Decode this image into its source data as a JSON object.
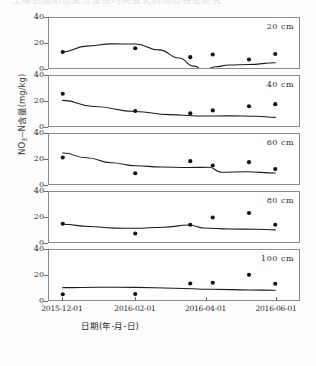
{
  "page": {
    "top_fragment": "土壤剖面硝态氮含量随时间变化的动态特征研究"
  },
  "chart_data": {
    "type": "scatter",
    "title": "",
    "subtitle": "",
    "xlabel": "日期(年-月-日)",
    "ylabel_html": "NO3--N含量(mg/kg)",
    "ylabel_parts": {
      "pre": "NO",
      "sub": "3",
      "post": "--N含量(mg/kg)"
    },
    "grid": false,
    "legend": "none",
    "ylim": [
      0,
      40
    ],
    "yticks": [
      0,
      20,
      40
    ],
    "xlim": [
      "2015-12-01",
      "2016-06-20"
    ],
    "xticks": [
      "2015-12-01",
      "2016-02-01",
      "2016-04-01",
      "2016-06-01"
    ],
    "xtick_positions": [
      0.055,
      0.345,
      0.625,
      0.905
    ],
    "panels": [
      {
        "depth_label": "20 cm",
        "points": [
          {
            "x": 0.055,
            "y": 12.8
          },
          {
            "x": 0.345,
            "y": 15.8
          },
          {
            "x": 0.565,
            "y": 8.7
          },
          {
            "x": 0.655,
            "y": 10.8
          },
          {
            "x": 0.8,
            "y": 6.8
          },
          {
            "x": 0.905,
            "y": 11.2
          }
        ],
        "fit": [
          {
            "x": 0.055,
            "y": 13.0
          },
          {
            "x": 0.15,
            "y": 17.5
          },
          {
            "x": 0.25,
            "y": 19.3
          },
          {
            "x": 0.345,
            "y": 19.2
          },
          {
            "x": 0.44,
            "y": 14.5
          },
          {
            "x": 0.52,
            "y": 8.0
          },
          {
            "x": 0.58,
            "y": 1.5
          },
          {
            "x": 0.62,
            "y": -1.6
          },
          {
            "x": 0.665,
            "y": 1.0
          },
          {
            "x": 0.72,
            "y": 2.4
          },
          {
            "x": 0.8,
            "y": 2.8
          },
          {
            "x": 0.905,
            "y": 4.2
          }
        ]
      },
      {
        "depth_label": "40 cm",
        "points": [
          {
            "x": 0.055,
            "y": 25.8
          },
          {
            "x": 0.345,
            "y": 12.0
          },
          {
            "x": 0.565,
            "y": 10.2
          },
          {
            "x": 0.655,
            "y": 12.5
          },
          {
            "x": 0.8,
            "y": 15.8
          },
          {
            "x": 0.905,
            "y": 17.5
          }
        ],
        "fit": [
          {
            "x": 0.055,
            "y": 20.5
          },
          {
            "x": 0.18,
            "y": 15.6
          },
          {
            "x": 0.345,
            "y": 11.6
          },
          {
            "x": 0.48,
            "y": 9.1
          },
          {
            "x": 0.6,
            "y": 8.0
          },
          {
            "x": 0.72,
            "y": 8.1
          },
          {
            "x": 0.83,
            "y": 7.8
          },
          {
            "x": 0.905,
            "y": 6.9
          }
        ]
      },
      {
        "depth_label": "60 cm",
        "points": [
          {
            "x": 0.055,
            "y": 21.2
          },
          {
            "x": 0.345,
            "y": 8.6
          },
          {
            "x": 0.565,
            "y": 18.3
          },
          {
            "x": 0.655,
            "y": 14.8
          },
          {
            "x": 0.8,
            "y": 17.5
          },
          {
            "x": 0.905,
            "y": 12.0
          }
        ],
        "fit": [
          {
            "x": 0.055,
            "y": 24.8
          },
          {
            "x": 0.15,
            "y": 21.0
          },
          {
            "x": 0.25,
            "y": 17.0
          },
          {
            "x": 0.345,
            "y": 14.6
          },
          {
            "x": 0.45,
            "y": 13.6
          },
          {
            "x": 0.56,
            "y": 13.2
          },
          {
            "x": 0.64,
            "y": 13.4
          },
          {
            "x": 0.69,
            "y": 9.4
          },
          {
            "x": 0.79,
            "y": 9.8
          },
          {
            "x": 0.905,
            "y": 8.8
          }
        ]
      },
      {
        "depth_label": "80 cm",
        "points": [
          {
            "x": 0.055,
            "y": 14.6
          },
          {
            "x": 0.345,
            "y": 6.8
          },
          {
            "x": 0.565,
            "y": 13.8
          },
          {
            "x": 0.655,
            "y": 19.6
          },
          {
            "x": 0.8,
            "y": 23.2
          },
          {
            "x": 0.905,
            "y": 13.8
          }
        ],
        "fit": [
          {
            "x": 0.055,
            "y": 14.2
          },
          {
            "x": 0.16,
            "y": 12.4
          },
          {
            "x": 0.26,
            "y": 11.1
          },
          {
            "x": 0.345,
            "y": 11.0
          },
          {
            "x": 0.46,
            "y": 11.8
          },
          {
            "x": 0.56,
            "y": 13.6
          },
          {
            "x": 0.62,
            "y": 11.2
          },
          {
            "x": 0.72,
            "y": 10.4
          },
          {
            "x": 0.83,
            "y": 10.2
          },
          {
            "x": 0.905,
            "y": 9.7
          }
        ]
      },
      {
        "depth_label": "100 cm",
        "points": [
          {
            "x": 0.055,
            "y": 4.6
          },
          {
            "x": 0.345,
            "y": 4.8
          },
          {
            "x": 0.565,
            "y": 13.2
          },
          {
            "x": 0.655,
            "y": 13.8
          },
          {
            "x": 0.8,
            "y": 20.2
          },
          {
            "x": 0.905,
            "y": 13.0
          }
        ],
        "fit": [
          {
            "x": 0.055,
            "y": 9.9
          },
          {
            "x": 0.2,
            "y": 10.2
          },
          {
            "x": 0.345,
            "y": 10.1
          },
          {
            "x": 0.5,
            "y": 9.4
          },
          {
            "x": 0.65,
            "y": 8.6
          },
          {
            "x": 0.8,
            "y": 8.0
          },
          {
            "x": 0.905,
            "y": 7.8
          }
        ]
      }
    ]
  }
}
